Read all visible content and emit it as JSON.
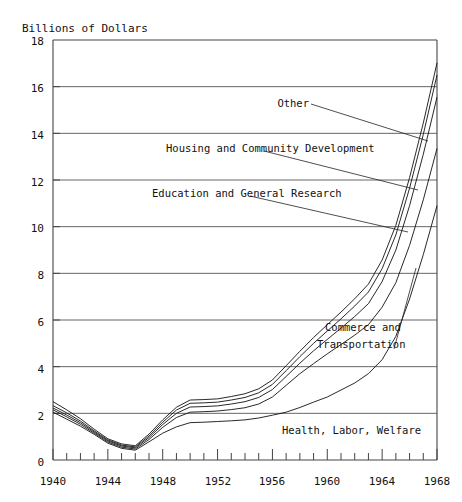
{
  "chart_data": {
    "type": "area",
    "title": "Billions of Dollars",
    "xlabel": "",
    "ylabel": "Billions of Dollars",
    "xlim": [
      1940,
      1968
    ],
    "ylim": [
      0,
      18
    ],
    "grid": true,
    "stacked": true,
    "legend_position": "inline-annotations",
    "yticks": [
      0,
      2,
      4,
      6,
      8,
      10,
      12,
      14,
      16,
      18
    ],
    "ytick_labels": [
      "0",
      "2",
      "4",
      "6",
      "8",
      "10",
      "12",
      "14",
      "16",
      "18"
    ],
    "xticks": [
      1940,
      1944,
      1948,
      1952,
      1956,
      1960,
      1964,
      1968
    ],
    "xtick_labels": [
      "1940",
      "1944",
      "1948",
      "1952",
      "1956",
      "1960",
      "1964",
      "1968"
    ],
    "xminor_step": 1,
    "x": [
      1940,
      1941,
      1942,
      1943,
      1944,
      1945,
      1946,
      1947,
      1948,
      1949,
      1950,
      1951,
      1952,
      1953,
      1954,
      1955,
      1956,
      1957,
      1958,
      1959,
      1960,
      1961,
      1962,
      1963,
      1964,
      1965,
      1966,
      1967,
      1968
    ],
    "series": [
      {
        "name": "Health, Labor, Welfare",
        "label": "Health, Labor, Welfare",
        "values": [
          2.05,
          1.75,
          1.45,
          1.1,
          0.72,
          0.5,
          0.42,
          0.78,
          1.15,
          1.42,
          1.6,
          1.62,
          1.65,
          1.68,
          1.72,
          1.8,
          1.92,
          2.05,
          2.25,
          2.48,
          2.7,
          3.0,
          3.3,
          3.7,
          4.3,
          5.3,
          6.9,
          8.8,
          10.9
        ],
        "cumulative_top": [
          2.05,
          1.75,
          1.45,
          1.1,
          0.72,
          0.5,
          0.42,
          0.78,
          1.15,
          1.42,
          1.6,
          1.62,
          1.65,
          1.68,
          1.72,
          1.8,
          1.92,
          2.05,
          2.25,
          2.48,
          2.7,
          3.0,
          3.3,
          3.7,
          4.3,
          5.3,
          6.9,
          8.8,
          10.9
        ]
      },
      {
        "name": "Commerce and Transportation",
        "label": "Commerce and Transportation",
        "values": [
          0.1,
          0.1,
          0.08,
          0.05,
          0.05,
          0.05,
          0.05,
          0.1,
          0.25,
          0.4,
          0.45,
          0.45,
          0.45,
          0.48,
          0.52,
          0.6,
          0.78,
          1.15,
          1.45,
          1.65,
          1.85,
          1.95,
          2.05,
          2.1,
          2.25,
          2.3,
          2.3,
          2.35,
          2.45
        ],
        "cumulative_top": [
          2.15,
          1.85,
          1.53,
          1.15,
          0.77,
          0.55,
          0.47,
          0.88,
          1.4,
          1.82,
          2.05,
          2.07,
          2.1,
          2.16,
          2.24,
          2.4,
          2.7,
          3.2,
          3.7,
          4.13,
          4.55,
          4.95,
          5.35,
          5.8,
          6.55,
          7.6,
          9.2,
          11.15,
          13.35
        ]
      },
      {
        "name": "Education and General Research",
        "label": "Education and General Research",
        "values": [
          0.08,
          0.08,
          0.07,
          0.05,
          0.05,
          0.05,
          0.05,
          0.08,
          0.12,
          0.18,
          0.22,
          0.22,
          0.22,
          0.24,
          0.26,
          0.28,
          0.32,
          0.38,
          0.45,
          0.55,
          0.62,
          0.7,
          0.8,
          0.9,
          1.1,
          1.4,
          1.7,
          1.95,
          2.2
        ],
        "cumulative_top": [
          2.23,
          1.93,
          1.6,
          1.2,
          0.82,
          0.6,
          0.52,
          0.96,
          1.52,
          2.0,
          2.27,
          2.29,
          2.32,
          2.4,
          2.5,
          2.68,
          3.02,
          3.58,
          4.15,
          4.68,
          5.17,
          5.65,
          6.15,
          6.7,
          7.65,
          9.0,
          10.9,
          13.1,
          15.55
        ]
      },
      {
        "name": "Housing and Community Development",
        "label": "Housing and Community Development",
        "values": [
          0.1,
          0.09,
          0.07,
          0.05,
          0.04,
          0.04,
          0.04,
          0.07,
          0.1,
          0.14,
          0.16,
          0.16,
          0.16,
          0.17,
          0.18,
          0.2,
          0.22,
          0.25,
          0.28,
          0.32,
          0.36,
          0.4,
          0.45,
          0.5,
          0.55,
          0.65,
          0.75,
          0.85,
          0.95
        ],
        "cumulative_top": [
          2.33,
          2.02,
          1.67,
          1.25,
          0.86,
          0.64,
          0.56,
          1.03,
          1.62,
          2.14,
          2.43,
          2.45,
          2.48,
          2.57,
          2.68,
          2.88,
          3.24,
          3.83,
          4.43,
          5.0,
          5.53,
          6.05,
          6.6,
          7.2,
          8.2,
          9.65,
          11.65,
          13.95,
          16.5
        ]
      },
      {
        "name": "Other",
        "label": "Other",
        "values": [
          0.17,
          0.13,
          0.1,
          0.07,
          0.05,
          0.05,
          0.05,
          0.08,
          0.1,
          0.12,
          0.14,
          0.14,
          0.14,
          0.15,
          0.16,
          0.17,
          0.19,
          0.21,
          0.23,
          0.25,
          0.27,
          0.29,
          0.31,
          0.34,
          0.37,
          0.41,
          0.45,
          0.49,
          0.52
        ],
        "cumulative_top": [
          2.5,
          2.15,
          1.77,
          1.32,
          0.91,
          0.69,
          0.61,
          1.11,
          1.72,
          2.26,
          2.57,
          2.59,
          2.62,
          2.72,
          2.84,
          3.05,
          3.43,
          4.04,
          4.66,
          5.25,
          5.8,
          6.34,
          6.91,
          7.54,
          8.57,
          10.06,
          12.1,
          14.44,
          17.02
        ]
      }
    ],
    "annotations": [
      {
        "id": "other",
        "text": "Other"
      },
      {
        "id": "housing",
        "text": "Housing and Community Development"
      },
      {
        "id": "education",
        "text": "Education and General Research"
      },
      {
        "id": "commerce-1",
        "text": "Commerce and"
      },
      {
        "id": "commerce-2",
        "text": "Transportation"
      },
      {
        "id": "health",
        "text": "Health, Labor, Welfare"
      }
    ]
  }
}
